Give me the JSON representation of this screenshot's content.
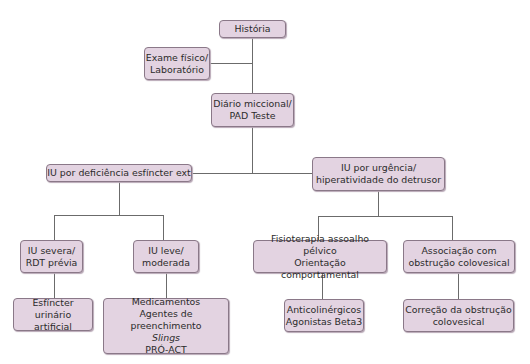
{
  "diagram": {
    "type": "flowchart",
    "nodes": {
      "historia": {
        "lines": [
          "História"
        ]
      },
      "exame": {
        "lines": [
          "Exame físico/",
          "Laboratório"
        ]
      },
      "diario": {
        "lines": [
          "Diário miccional/",
          "PAD Teste"
        ]
      },
      "deficiencia": {
        "lines": [
          "IU por deficiência esfíncter ext"
        ]
      },
      "urgencia": {
        "lines": [
          "IU por urgência/",
          "hiperatividade do detrusor"
        ]
      },
      "severa": {
        "lines": [
          "IU severa/",
          "RDT prévia"
        ]
      },
      "leve": {
        "lines": [
          "IU leve/",
          "moderada"
        ]
      },
      "esfincter": {
        "lines": [
          "Esfíncter urinário",
          "artificial"
        ]
      },
      "medicamentos": {
        "lines": [
          "Medicamentos",
          "Agentes de preenchimento",
          "Slings",
          "PRÓ-ACT"
        ]
      },
      "fisioterapia": {
        "lines": [
          "Fisioterapia assoalho pélvico",
          "Orientação comportamental"
        ]
      },
      "associacao": {
        "lines": [
          "Associação com",
          "obstrução colovesical"
        ]
      },
      "anticolinergicos": {
        "lines": [
          "Anticolinérgicos",
          "Agonistas Beta3"
        ]
      },
      "correcao": {
        "lines": [
          "Correção da obstrução",
          "colovesical"
        ]
      }
    },
    "edges": [
      [
        "historia",
        "exame"
      ],
      [
        "historia",
        "diario"
      ],
      [
        "diario",
        "deficiencia"
      ],
      [
        "diario",
        "urgencia"
      ],
      [
        "deficiencia",
        "severa"
      ],
      [
        "deficiencia",
        "leve"
      ],
      [
        "severa",
        "esfincter"
      ],
      [
        "leve",
        "medicamentos"
      ],
      [
        "urgencia",
        "fisioterapia"
      ],
      [
        "urgencia",
        "associacao"
      ],
      [
        "fisioterapia",
        "anticolinergicos"
      ],
      [
        "associacao",
        "correcao"
      ]
    ],
    "colors": {
      "node_fill": "#e3d3e1",
      "node_border": "#8a7888",
      "line": "#6b6b6b"
    }
  }
}
